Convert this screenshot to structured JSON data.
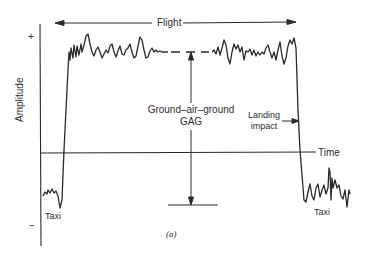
{
  "figure": {
    "caption": "(a)",
    "y_axis_label": "Amplitude",
    "x_axis_label": "Time",
    "y_plus": "+",
    "y_minus": "−",
    "flight_label": "Flight",
    "gag_label_line1": "Ground–air–ground",
    "gag_label_line2": "GAG",
    "landing_label_line1": "Landing",
    "landing_label_line2": "impact",
    "taxi_left_label": "Taxi",
    "taxi_right_label": "Taxi",
    "line_color": "#2a2a2a"
  }
}
